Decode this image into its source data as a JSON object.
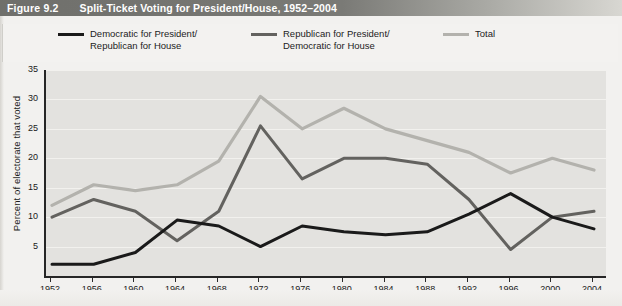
{
  "figure": {
    "number": "Figure 9.2",
    "title": "Split-Ticket Voting for President/House, 1952–2004"
  },
  "legend": {
    "position": "top",
    "items": [
      {
        "name": "democratic",
        "label": "Democratic for President/\nRepublican for House",
        "color": "#1a1a1a"
      },
      {
        "name": "republican",
        "label": "Republican for President/\nDemocratic for House",
        "color": "#63625f"
      },
      {
        "name": "total",
        "label": "Total",
        "color": "#b3b2ad"
      }
    ]
  },
  "axes": {
    "ylabel": "Percent of electorate that voted",
    "yticks": [
      "5",
      "10",
      "15",
      "20",
      "25",
      "30",
      "35"
    ],
    "xticks": [
      "1952",
      "1956",
      "1960",
      "1964",
      "1968",
      "1972",
      "1976",
      "1980",
      "1984",
      "1988",
      "1992",
      "1996",
      "2000",
      "2004"
    ]
  },
  "colors": {
    "plot_background": "#e3e2df",
    "gridline": "#f4f3f1",
    "axis": "#262626",
    "title_bar_dark": "#6f6f6b",
    "title_text": "#ffffff"
  },
  "chart_data": {
    "type": "line",
    "title": "Split-Ticket Voting for President/House, 1952–2004",
    "xlabel": "",
    "ylabel": "Percent of electorate that voted",
    "x": [
      1952,
      1956,
      1960,
      1964,
      1968,
      1972,
      1976,
      1980,
      1984,
      1988,
      1992,
      1996,
      2000,
      2004
    ],
    "categories": [
      "1952",
      "1956",
      "1960",
      "1964",
      "1968",
      "1972",
      "1976",
      "1980",
      "1984",
      "1988",
      "1992",
      "1996",
      "2000",
      "2004"
    ],
    "xlim": [
      1952,
      2004
    ],
    "ylim": [
      0,
      35
    ],
    "grid": true,
    "legend_position": "top",
    "series": [
      {
        "name": "Democratic for President/Republican for House",
        "color": "#1a1a1a",
        "values": [
          2,
          2,
          4,
          9.5,
          8.5,
          5,
          8.5,
          7.5,
          7,
          7.5,
          10.5,
          14,
          10,
          8
        ]
      },
      {
        "name": "Republican for President/Democratic for House",
        "color": "#63625f",
        "values": [
          10,
          13,
          11,
          6,
          11,
          25.5,
          16.5,
          20,
          20,
          19,
          13,
          4.5,
          10,
          11
        ]
      },
      {
        "name": "Total",
        "color": "#b3b2ad",
        "values": [
          12,
          15.5,
          14.5,
          15.5,
          19.5,
          30.5,
          25,
          28.5,
          25,
          23,
          21,
          17.5,
          20,
          18
        ]
      }
    ]
  }
}
